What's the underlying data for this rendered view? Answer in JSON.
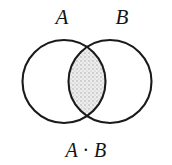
{
  "figure": {
    "type": "venn-diagram",
    "background_color": "#ffffff",
    "stroke_color": "#1a1a1a",
    "stroke_width": 2,
    "shading": {
      "region": "intersection",
      "style": "stipple",
      "fill_color": "#ebebeb",
      "dot_color": "#9a9a9a"
    },
    "labels": {
      "left_set": "A",
      "right_set": "B",
      "intersection": "A · B"
    },
    "geometry": {
      "left_circle": {
        "cx": 64,
        "cy": 81.5,
        "r": 41.5
      },
      "right_circle": {
        "cx": 110,
        "cy": 81.5,
        "r": 41.5
      },
      "crossing_points": [
        {
          "x": 87,
          "y": 46
        },
        {
          "x": 87,
          "y": 117
        }
      ]
    }
  }
}
